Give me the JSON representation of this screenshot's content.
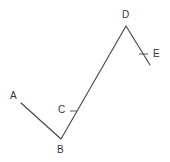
{
  "diagram": {
    "type": "polyline",
    "stroke_color": "#444444",
    "label_color": "#333333",
    "points": [
      {
        "name": "A",
        "x": 21,
        "y": 103
      },
      {
        "name": "B",
        "x": 61,
        "y": 139
      },
      {
        "name": "D",
        "x": 126,
        "y": 26
      },
      {
        "name": "E",
        "x": 150,
        "y": 65
      }
    ],
    "labels": {
      "A": "A",
      "B": "B",
      "C": "C",
      "D": "D",
      "E": "E"
    },
    "ticks": [
      {
        "name": "C",
        "note": "tick mark on segment B–D"
      },
      {
        "name": "E",
        "note": "tick mark on segment D–E"
      }
    ]
  }
}
